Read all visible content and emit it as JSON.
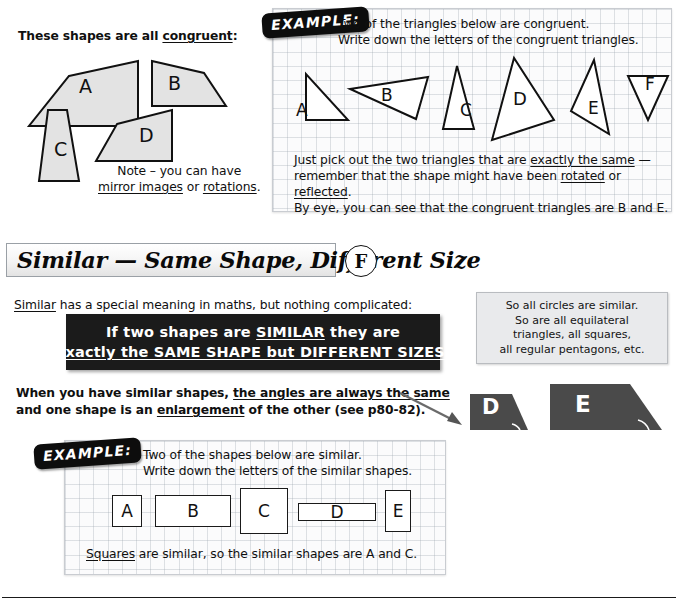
{
  "congruent_section": {
    "intro_text_prefix": "These shapes are all ",
    "intro_text_underlined": "congruent",
    "intro_text_suffix": ":",
    "shape_labels": [
      "A",
      "B",
      "C",
      "D"
    ],
    "note_line1": "Note – you can have",
    "note_line2_part1": "mirror images",
    "note_line2_mid": " or ",
    "note_line2_part2": "rotations",
    "note_line2_end": "."
  },
  "example1": {
    "badge": "EXAMPLE:",
    "question_line1": "Two of the triangles below are congruent.",
    "question_line2": "Write down the letters of the congruent triangles.",
    "triangle_labels": [
      "A",
      "B",
      "C",
      "D",
      "E",
      "F"
    ],
    "answer_line1_a": "Just pick out the two triangles that are ",
    "answer_line1_u": "exactly the same",
    "answer_line1_b": " —",
    "answer_line2_a": "remember that the shape might have been ",
    "answer_line2_u1": "rotated",
    "answer_line2_mid": " or ",
    "answer_line2_u2": "reflected",
    "answer_line2_b": ".",
    "answer_line3": "By eye, you can see that the congruent triangles are B and E."
  },
  "similar_section": {
    "heading": "Similar — Same Shape, Different Size",
    "grade_badge": "F",
    "intro_underlined": "Similar",
    "intro_rest": " has a special meaning in maths, but nothing complicated:",
    "banner_line1_a": "If two shapes are ",
    "banner_line1_u": "SIMILAR",
    "banner_line1_b": " they are",
    "banner_line2_u1": "exactly the SAME SHAPE but DIFFERENT SIZES",
    "banner_line2_end": ".",
    "sidenote_lines": [
      "So all circles are similar.",
      "So are all equilateral",
      "triangles, all squares,",
      "all regular pentagons, etc."
    ],
    "para_line1_a": "When you have similar shapes, ",
    "para_line1_u": "the angles are always the same",
    "para_line2_a": "and one shape is an ",
    "para_line2_u": "enlargement",
    "para_line2_b": " of the other (see p80-82).",
    "dark_shape_labels": [
      "D",
      "E"
    ]
  },
  "example2": {
    "badge": "EXAMPLE:",
    "question_line1": "Two of the shapes below are similar.",
    "question_line2": "Write down the letters of the similar shapes.",
    "rect_labels": [
      "A",
      "B",
      "C",
      "D",
      "E"
    ],
    "answer_u": "Squares",
    "answer_rest": " are similar, so the similar shapes are A and C."
  },
  "colors": {
    "shape_fill": "#e3e3e3",
    "dark_shape_fill": "#4a4a4a",
    "banner_bg": "#1b1b1b",
    "sidenote_bg": "#e9eaec",
    "grid_line": "#96a0aa"
  }
}
